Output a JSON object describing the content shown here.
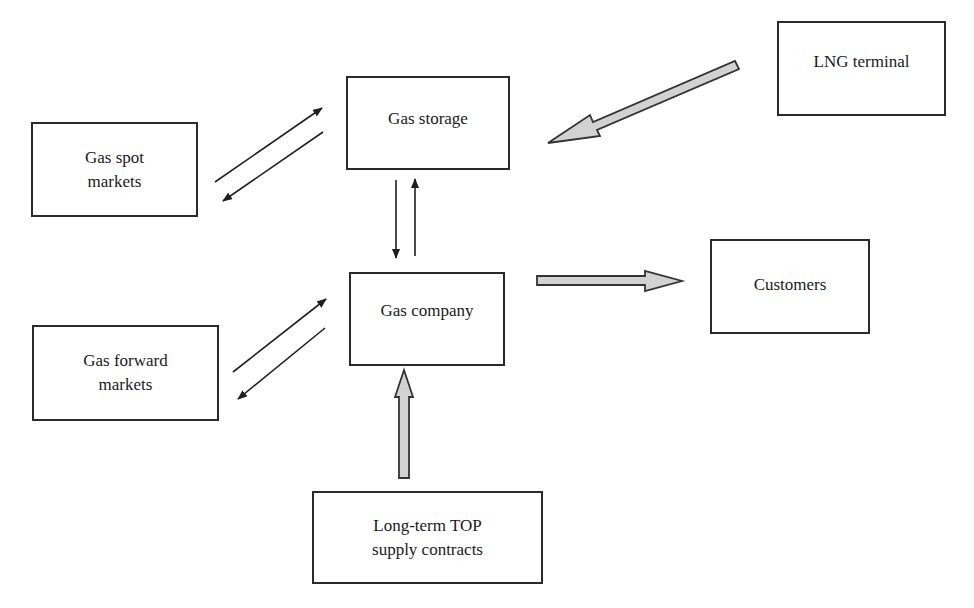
{
  "diagram": {
    "type": "flow",
    "nodes": {
      "gas_spot_markets": {
        "line1": "Gas spot",
        "line2": "markets"
      },
      "gas_storage": {
        "line1": "Gas storage"
      },
      "lng_terminal": {
        "line1": "LNG terminal"
      },
      "gas_forward_markets": {
        "line1": "Gas forward",
        "line2": "markets"
      },
      "gas_company": {
        "line1": "Gas company"
      },
      "customers": {
        "line1": "Customers"
      },
      "long_term_top": {
        "line1": "Long-term TOP",
        "line2": "supply contracts"
      }
    },
    "edges": [
      {
        "from": "Gas spot markets",
        "to": "Gas storage",
        "style": "thin-arrow"
      },
      {
        "from": "Gas storage",
        "to": "Gas spot markets",
        "style": "thin-arrow"
      },
      {
        "from": "Gas storage",
        "to": "Gas company",
        "style": "thin-arrow"
      },
      {
        "from": "Gas company",
        "to": "Gas storage",
        "style": "thin-arrow"
      },
      {
        "from": "LNG terminal",
        "to": "Gas storage",
        "style": "block-arrow"
      },
      {
        "from": "Gas forward markets",
        "to": "Gas company",
        "style": "thin-arrow"
      },
      {
        "from": "Gas company",
        "to": "Gas forward markets",
        "style": "thin-arrow"
      },
      {
        "from": "Gas company",
        "to": "Customers",
        "style": "block-arrow"
      },
      {
        "from": "Long-term TOP supply contracts",
        "to": "Gas company",
        "style": "block-arrow"
      }
    ],
    "colors": {
      "stroke": "#2a2a2a",
      "block_arrow_fill": "#d2d2d2",
      "block_arrow_stroke": "#333333",
      "background": "#ffffff"
    }
  }
}
